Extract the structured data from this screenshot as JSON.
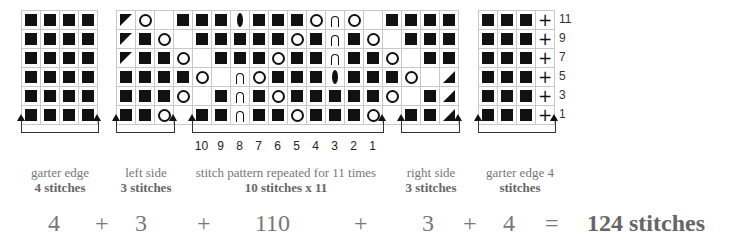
{
  "chart_data": {
    "type": "knitting-chart",
    "title": "",
    "row_numbers": [
      "11",
      "9",
      "7",
      "5",
      "3",
      "1"
    ],
    "column_numbers": [
      "10",
      "9",
      "8",
      "7",
      "6",
      "5",
      "4",
      "3",
      "2",
      "1"
    ],
    "legend_symbols": {
      "k": "knit (filled square)",
      "o": "yarn over (circle)",
      "cdd": "central double decrease (lens)",
      "arch": "arch stitch",
      "ssk": "left-leaning decrease (triangle top-left)",
      "k2tog": "right-leaning decrease (triangle bottom-right)",
      "p": "plus (edge stitch)",
      "_": "no stitch"
    },
    "left_garter": [
      [
        "k",
        "k",
        "k",
        "k"
      ],
      [
        "k",
        "k",
        "k",
        "k"
      ],
      [
        "k",
        "k",
        "k",
        "k"
      ],
      [
        "k",
        "k",
        "k",
        "k"
      ],
      [
        "k",
        "k",
        "k",
        "k"
      ],
      [
        "k",
        "k",
        "k",
        "k"
      ]
    ],
    "main_grid": [
      [
        "ssk",
        "o",
        "_",
        "k",
        "k",
        "k",
        "cdd",
        "k",
        "k",
        "k",
        "o",
        "arch",
        "o",
        "_",
        "k",
        "k",
        "k",
        "k"
      ],
      [
        "ssk",
        "k",
        "o",
        "_",
        "k",
        "k",
        "k",
        "k",
        "k",
        "o",
        "k",
        "arch",
        "k",
        "o",
        "_",
        "k",
        "k",
        "k"
      ],
      [
        "ssk",
        "k",
        "k",
        "o",
        "_",
        "k",
        "k",
        "k",
        "o",
        "k",
        "k",
        "arch",
        "k",
        "k",
        "o",
        "_",
        "k",
        "k"
      ],
      [
        "k",
        "k",
        "k",
        "k",
        "o",
        "_",
        "arch",
        "o",
        "k",
        "k",
        "k",
        "cdd",
        "k",
        "k",
        "k",
        "o",
        "_",
        "k2tog"
      ],
      [
        "k",
        "k",
        "k",
        "o",
        "_",
        "k",
        "arch",
        "k",
        "o",
        "k",
        "k",
        "k",
        "k",
        "k",
        "o",
        "_",
        "k",
        "k2tog"
      ],
      [
        "k",
        "k",
        "o",
        "_",
        "k",
        "k",
        "arch",
        "k",
        "k",
        "o",
        "k",
        "k",
        "k",
        "o",
        "_",
        "k",
        "k",
        "k2tog"
      ]
    ],
    "right_garter": [
      [
        "k",
        "k",
        "k",
        "p"
      ],
      [
        "k",
        "k",
        "k",
        "p"
      ],
      [
        "k",
        "k",
        "k",
        "p"
      ],
      [
        "k",
        "k",
        "k",
        "p"
      ],
      [
        "k",
        "k",
        "k",
        "p"
      ],
      [
        "k",
        "k",
        "k",
        "p"
      ]
    ]
  },
  "sections": [
    {
      "name": "garter edge",
      "count": "4 stitches"
    },
    {
      "name": "left side",
      "count": "3 stitches"
    },
    {
      "name": "stitch pattern repeated for 11 times",
      "count": "10 stitches x 11"
    },
    {
      "name": "right side",
      "count": "3 stitches"
    },
    {
      "name": "garter edge 4",
      "count": "stitches"
    }
  ],
  "equation": {
    "terms": [
      "4",
      "+",
      "3",
      "+",
      "110",
      "+",
      "3",
      "+",
      "4",
      "="
    ],
    "total": "124 stitches"
  }
}
